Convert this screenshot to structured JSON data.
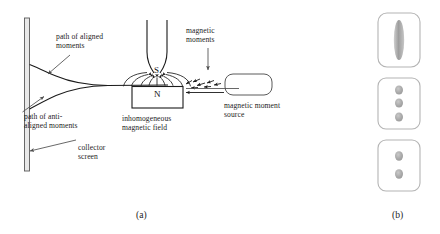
{
  "figure": {
    "title_hidden": "",
    "panels": [
      {
        "id": "a",
        "caption": "(a)"
      },
      {
        "id": "b",
        "caption": "(b)"
      }
    ]
  },
  "panel_a": {
    "labels": {
      "path_aligned": "path of aligned\nmoments",
      "path_antialigned": "path of anti-\naligned moments",
      "collector_screen": "collector\nscreen",
      "magnetic_moments": "magnetic\nmoments",
      "inhomogeneous_field": "inhomogeneous\nmagnetic field",
      "moment_source": "magnetic moment\nsource"
    },
    "poles": {
      "south": "S",
      "north": "N"
    },
    "colors": {
      "stroke": "#1a1a1a",
      "screen_fill": "#e8e8e8",
      "leader": "#555555",
      "background": "#ffffff"
    }
  },
  "panel_b": {
    "boxes": [
      {
        "name": "continuous-band-result",
        "pattern": "band",
        "spots": 1
      },
      {
        "name": "three-spot-result",
        "pattern": "spots",
        "spots": 3
      },
      {
        "name": "two-spot-result",
        "pattern": "spots",
        "spots": 2
      }
    ],
    "colors": {
      "box_stroke": "#b4b4b4",
      "spot_fill": "#a8a8a8",
      "band_fill": "#b0b0b0"
    }
  }
}
